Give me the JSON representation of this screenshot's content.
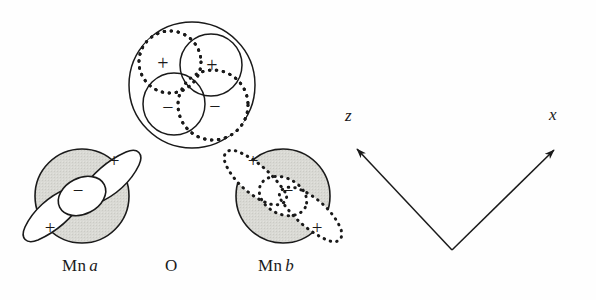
{
  "figure": {
    "kind": "orbital-overlap-diagram",
    "background_color": "#fefefe",
    "stroke_color": "#1a1a1a",
    "sphere_fill_color": "#d7d7d2",
    "lobe_fill_color": "#ffffff",
    "width": 596,
    "height": 300
  },
  "atoms": [
    {
      "id": "mn-a",
      "label_text": "Mn",
      "label_italic": "a",
      "label_x": 62,
      "label_y": 268,
      "center_x": 82,
      "center_y": 196,
      "sphere_radius": 47,
      "outline_style": "solid",
      "orbital_lobes": [
        {
          "sign": "+",
          "position": "upper-right"
        },
        {
          "sign": "−",
          "position": "center"
        },
        {
          "sign": "+",
          "position": "lower-left"
        }
      ]
    },
    {
      "id": "oxygen",
      "label_text": "O",
      "label_italic": "",
      "label_x": 165,
      "label_y": 268,
      "center_x": 192,
      "center_y": 85,
      "sphere_radius": 63,
      "outline_style": "solid",
      "orbital_lobes": [
        {
          "sign": "+",
          "position": "upper-left",
          "outline": "dotted"
        },
        {
          "sign": "+",
          "position": "upper-right",
          "outline": "solid"
        },
        {
          "sign": "−",
          "position": "lower-left",
          "outline": "solid"
        },
        {
          "sign": "−",
          "position": "lower-right",
          "outline": "dotted"
        }
      ]
    },
    {
      "id": "mn-b",
      "label_text": "Mn",
      "label_italic": "b",
      "label_x": 258,
      "label_y": 268,
      "center_x": 283,
      "center_y": 196,
      "sphere_radius": 47,
      "outline_style": "solid",
      "orbital_lobes": [
        {
          "sign": "+",
          "position": "upper-left"
        },
        {
          "sign": "−",
          "position": "center"
        },
        {
          "sign": "+",
          "position": "lower-right"
        }
      ]
    }
  ],
  "axes": {
    "origin_x": 452,
    "origin_y": 250,
    "z": {
      "label": "z",
      "tip_x": 355,
      "tip_y": 147,
      "label_x": 345,
      "label_y": 118
    },
    "x": {
      "label": "x",
      "tip_x": 556,
      "tip_y": 148,
      "label_x": 549,
      "label_y": 117
    }
  },
  "signs": {
    "plus": "+",
    "minus": "−"
  }
}
